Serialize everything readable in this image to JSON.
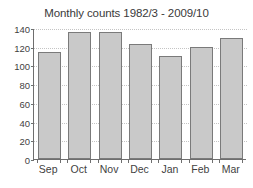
{
  "chart_data": {
    "type": "bar",
    "title": "Monthly counts 1982/3 - 2009/10",
    "xlabel": "",
    "ylabel": "",
    "categories": [
      "Sep",
      "Oct",
      "Nov",
      "Dec",
      "Jan",
      "Feb",
      "Mar"
    ],
    "values": [
      114,
      136,
      136,
      123,
      110,
      120,
      129
    ],
    "ylim": [
      0,
      140
    ],
    "yticks": [
      0,
      20,
      40,
      60,
      80,
      100,
      120,
      140
    ],
    "ytick_labels": [
      "0",
      "20",
      "40",
      "60",
      "80",
      "100",
      "120",
      "140"
    ],
    "grid": true,
    "legend": false,
    "bar_color": "#c9c9c9",
    "bar_edge_color": "#7a7a7a",
    "axis_color": "#6e6e6e",
    "grid_color": "#c4c4c4",
    "background_color": "#ffffff"
  }
}
